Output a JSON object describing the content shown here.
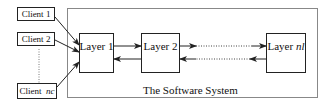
{
  "diagram": {
    "system": {
      "label": "The Software System"
    },
    "clients": [
      {
        "prefix": "Client",
        "suffix": "1"
      },
      {
        "prefix": "Client",
        "suffix": "2"
      },
      {
        "prefix": "Client",
        "suffix": "nc"
      }
    ],
    "layers": [
      {
        "prefix": "Layer",
        "suffix": "1"
      },
      {
        "prefix": "Layer",
        "suffix": "2"
      },
      {
        "prefix": "Layer",
        "suffix": "nl"
      }
    ],
    "colors": {
      "stroke": "#222222",
      "system_border": "#777777",
      "background": "#ffffff"
    }
  }
}
